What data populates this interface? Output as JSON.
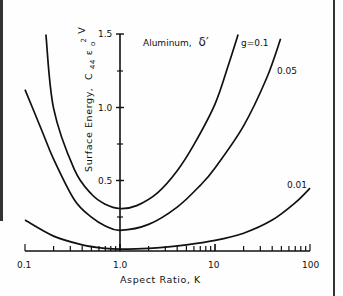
{
  "chart_data": {
    "type": "line",
    "title": "",
    "annotation": "Aluminum, δ′",
    "xlabel": "Aspect Ratio, K",
    "ylabel": "Surface Energy, C44 ε0² V",
    "xscale": "log",
    "xlim": [
      0.1,
      100
    ],
    "ylim": [
      0,
      1.5
    ],
    "x_ticks": [
      0.1,
      1.0,
      10,
      100
    ],
    "x_tick_labels": [
      "0.1",
      "1.0",
      "10",
      "100"
    ],
    "y_ticks": [
      0.5,
      1.0,
      1.5
    ],
    "y_tick_labels": [
      "0.5",
      "1.0",
      "1.5"
    ],
    "y_axis_position_x": 1.0,
    "grid": false,
    "legend": "inline curve labels",
    "series": [
      {
        "name": "g=0.1",
        "label": "g=0.1",
        "x": [
          0.166,
          0.2,
          0.33,
          0.5,
          0.7,
          1.0,
          1.5,
          2.5,
          4,
          6,
          10,
          14,
          17.5
        ],
        "values": [
          1.5,
          0.99,
          0.57,
          0.4,
          0.33,
          0.3,
          0.32,
          0.41,
          0.56,
          0.74,
          1.02,
          1.3,
          1.5
        ]
      },
      {
        "name": "g=0.05",
        "label": "0.05",
        "x": [
          0.1,
          0.15,
          0.2,
          0.33,
          0.5,
          0.7,
          1.0,
          2,
          4,
          7,
          10,
          20,
          35,
          49
        ],
        "values": [
          1.12,
          0.84,
          0.64,
          0.36,
          0.24,
          0.18,
          0.15,
          0.19,
          0.31,
          0.46,
          0.58,
          0.87,
          1.2,
          1.47
        ]
      },
      {
        "name": "g=0.01",
        "label": "0.01",
        "x": [
          0.1,
          0.2,
          0.4,
          0.7,
          1.0,
          2,
          5,
          10,
          20,
          40,
          70,
          100
        ],
        "values": [
          0.22,
          0.11,
          0.05,
          0.025,
          0.02,
          0.025,
          0.05,
          0.08,
          0.13,
          0.22,
          0.34,
          0.44
        ]
      }
    ]
  },
  "labels": {
    "annotation_main": "Aluminum,",
    "annotation_symbol": "δ′",
    "xlabel": "Aspect Ratio, K",
    "ylabel_prefix": "Surface Energy,",
    "ylabel_c": "C",
    "ylabel_c_sub": "44",
    "ylabel_eps": "ε",
    "ylabel_eps_sub": "o",
    "ylabel_eps_sup": "2",
    "ylabel_v": "V",
    "curve_g01": "g=0.1",
    "curve_g005": "0.05",
    "curve_g001": "0.01",
    "x_tick_01": "0.1",
    "x_tick_1": "1.0",
    "x_tick_10": "10",
    "x_tick_100": "100",
    "y_tick_05": "0.5",
    "y_tick_10": "1.0",
    "y_tick_15": "1.5"
  }
}
